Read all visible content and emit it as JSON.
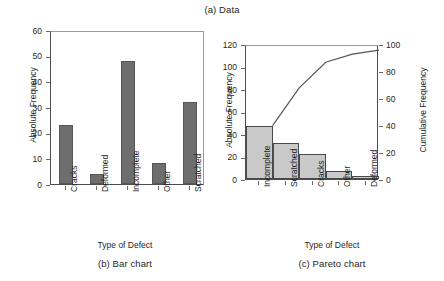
{
  "figure": {
    "caption_top": "(a) Data",
    "caption_b": "(b)  Bar chart",
    "caption_c": "(c)  Pareto chart"
  },
  "chart_data": [
    {
      "id": "bar-chart",
      "type": "bar",
      "title": "(b)  Bar chart",
      "xlabel": "Type of Defect",
      "ylabel": "Absolute Frequency",
      "categories": [
        "Cracks",
        "Deformed",
        "Incomplete",
        "Other",
        "Scratched"
      ],
      "values": [
        23,
        4,
        48,
        8,
        32
      ],
      "ylim": [
        0,
        60
      ],
      "yticks": [
        0,
        10,
        20,
        30,
        40,
        50,
        60
      ],
      "grid": false,
      "legend": "none",
      "bar_color": "#6e6e6e"
    },
    {
      "id": "pareto-chart",
      "type": "bar",
      "title": "(c)  Pareto chart",
      "xlabel": "Type of Defect",
      "ylabel": "Absolute Frequency",
      "ylabel_right": "Cumulative Frequency",
      "categories": [
        "Incomplete",
        "Scratched",
        "Cracks",
        "Other",
        "Deformed"
      ],
      "values": [
        47,
        32,
        22,
        7,
        3
      ],
      "cumulative_percent": [
        41,
        69,
        88,
        94,
        97
      ],
      "ylim": [
        0,
        120
      ],
      "yticks": [
        0,
        20,
        40,
        60,
        80,
        100,
        120
      ],
      "ylim_right": [
        0,
        100
      ],
      "yticks_right": [
        0,
        20,
        40,
        60,
        80,
        100
      ],
      "grid": false,
      "legend": "none",
      "bar_color": "#c9c9c9",
      "line_color": "#555555"
    }
  ]
}
